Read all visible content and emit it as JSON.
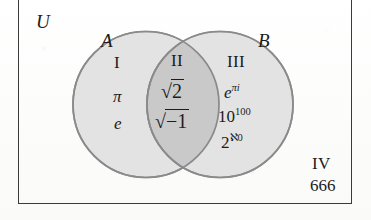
{
  "figure": {
    "type": "venn-diagram",
    "universe_label": "U",
    "background_color": "#fdfdfc",
    "border_color": "#3a3a3a",
    "circle_fill_color": "#e3e3e3",
    "intersection_fill_color": "#c9c9c9",
    "circle_stroke_color": "#8a8a8a"
  },
  "sets": {
    "left_label": "A",
    "right_label": "B"
  },
  "regions": [
    {
      "numeral": "I",
      "name": "left-only",
      "items": [
        "π",
        "e"
      ]
    },
    {
      "numeral": "II",
      "name": "intersection",
      "items": [
        "√2",
        "√−1"
      ]
    },
    {
      "numeral": "III",
      "name": "right-only",
      "items": [
        "e^{πi}",
        "10^{100}",
        "2^{ℵ0}"
      ]
    },
    {
      "numeral": "IV",
      "name": "outside",
      "items": [
        "666"
      ]
    }
  ],
  "labels": {
    "universe": "U",
    "set_a": "A",
    "set_b": "B",
    "region_1": "I",
    "region_2": "II",
    "region_3": "III",
    "region_4": "IV",
    "pi": "π",
    "e": "e",
    "sqrt2_sign": "√",
    "sqrt2_body": "2",
    "sqrtm1_sign": "√",
    "sqrtm1_body": "−1",
    "epi_base": "e",
    "epi_exp": "πi",
    "googol_base": "10",
    "googol_exp": "100",
    "beth_base": "2",
    "beth_exp": "ℵ0",
    "six_six_six": "666"
  }
}
